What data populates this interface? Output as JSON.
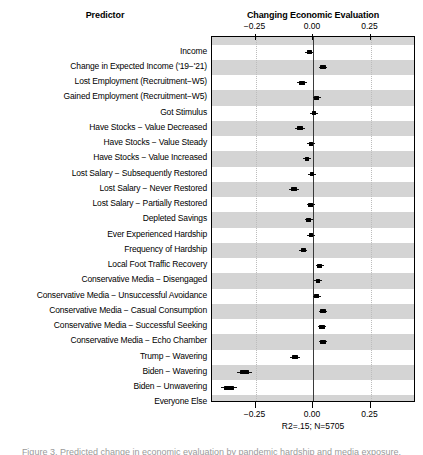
{
  "headers": {
    "predictor": "Predictor",
    "outcome": "Changing Economic Evaluation"
  },
  "fit_stats": "R2=.15; N=5705",
  "caption_clipped": "Figure 3. Predicted change in economic evaluation by pandemic hardship and media exposure.",
  "axis": {
    "ticks": [
      "−0.25",
      "0.00",
      "0.25"
    ],
    "tick_values": [
      -0.25,
      0.0,
      0.25
    ]
  },
  "colors": {
    "band": "#d4d4d4",
    "marker": "#000000",
    "zero_line": "#3a3a3a",
    "grid": "#bcbcbc",
    "panel_border": "#000000"
  },
  "chart_data": {
    "type": "scatter",
    "title": "Changing Economic Evaluation",
    "xlabel": "",
    "ylabel": "Predictor",
    "xlim": [
      -0.44,
      0.44
    ],
    "grid": true,
    "legend": false,
    "annotations": [
      "R2=.15; N=5705"
    ],
    "xticks": [
      -0.25,
      0.0,
      0.25
    ],
    "xticklabels": [
      "−0.25",
      "0.00",
      "0.25"
    ],
    "reference_line": 0.0,
    "categories": [
      "Income",
      "Change in Expected Income ('19−'21)",
      "Lost Employment (Recruitment−W5)",
      "Gained Employment (Recruitment−W5)",
      "Got Stimulus",
      "Have Stocks − Value Decreased",
      "Have Stocks − Value Steady",
      "Have Stocks − Value Increased",
      "Lost Salary − Subsequently Restored",
      "Lost Salary − Never Restored",
      "Lost Salary − Partially Restored",
      "Depleted Savings",
      "Ever Experienced Hardship",
      "Frequency of Hardship",
      "Local Foot Traffic Recovery",
      "Conservative Media − Disengaged",
      "Conservative Media − Unsuccessful Avoidance",
      "Conservative Media − Casual Consumption",
      "Conservative Media − Successful Seeking",
      "Conservative Media − Echo Chamber",
      "Trump − Wavering",
      "Biden − Wavering",
      "Biden − Unwavering",
      "Everyone Else"
    ],
    "estimates": [
      -0.017,
      0.043,
      -0.048,
      0.017,
      0.004,
      -0.056,
      -0.009,
      -0.026,
      -0.004,
      -0.083,
      -0.01,
      -0.018,
      -0.009,
      -0.043,
      0.03,
      0.022,
      0.017,
      0.043,
      0.039,
      0.043,
      -0.078,
      -0.297,
      -0.365,
      -0.145
    ],
    "ci_low": [
      -0.035,
      0.024,
      -0.069,
      0.0,
      -0.013,
      -0.077,
      -0.026,
      -0.043,
      -0.022,
      -0.104,
      -0.028,
      -0.035,
      -0.026,
      -0.061,
      0.013,
      0.004,
      -0.002,
      0.024,
      0.02,
      0.024,
      -0.098,
      -0.33,
      -0.402,
      -0.17
    ],
    "ci_high": [
      0.002,
      0.063,
      -0.028,
      0.035,
      0.021,
      -0.035,
      0.009,
      -0.009,
      0.013,
      -0.061,
      0.009,
      0.0,
      0.009,
      -0.026,
      0.048,
      0.039,
      0.035,
      0.063,
      0.057,
      0.063,
      -0.057,
      -0.265,
      -0.33,
      -0.12
    ]
  }
}
